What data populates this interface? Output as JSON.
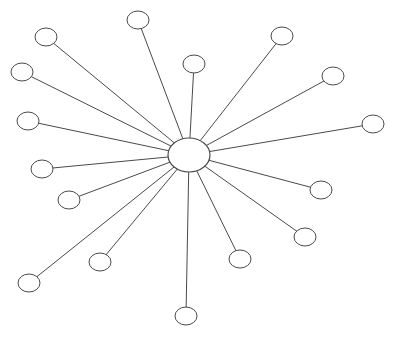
{
  "diagram": {
    "type": "spider-diagram",
    "hub": {
      "cx": 189,
      "cy": 155,
      "rx": 21,
      "ry": 17,
      "label": ""
    },
    "node_radius": {
      "rx": 11,
      "ry": 9
    },
    "colors": {
      "stroke": "#4a4a4a",
      "fill": "#ffffff",
      "background": "#ffffff"
    },
    "nodes": [
      {
        "id": "n1",
        "cx": 138,
        "cy": 20,
        "label": ""
      },
      {
        "id": "n2",
        "cx": 46,
        "cy": 37,
        "label": ""
      },
      {
        "id": "n3",
        "cx": 22,
        "cy": 72,
        "label": ""
      },
      {
        "id": "n4",
        "cx": 28,
        "cy": 121,
        "label": ""
      },
      {
        "id": "n5",
        "cx": 194,
        "cy": 64,
        "label": ""
      },
      {
        "id": "n6",
        "cx": 282,
        "cy": 36,
        "label": ""
      },
      {
        "id": "n7",
        "cx": 333,
        "cy": 76,
        "label": ""
      },
      {
        "id": "n8",
        "cx": 373,
        "cy": 124,
        "label": ""
      },
      {
        "id": "n9",
        "cx": 321,
        "cy": 190,
        "label": ""
      },
      {
        "id": "n10",
        "cx": 305,
        "cy": 237,
        "label": ""
      },
      {
        "id": "n11",
        "cx": 240,
        "cy": 259,
        "label": ""
      },
      {
        "id": "n12",
        "cx": 186,
        "cy": 316,
        "label": ""
      },
      {
        "id": "n13",
        "cx": 100,
        "cy": 262,
        "label": ""
      },
      {
        "id": "n14",
        "cx": 29,
        "cy": 283,
        "label": ""
      },
      {
        "id": "n15",
        "cx": 69,
        "cy": 200,
        "label": ""
      },
      {
        "id": "n16",
        "cx": 42,
        "cy": 169,
        "label": ""
      }
    ]
  }
}
